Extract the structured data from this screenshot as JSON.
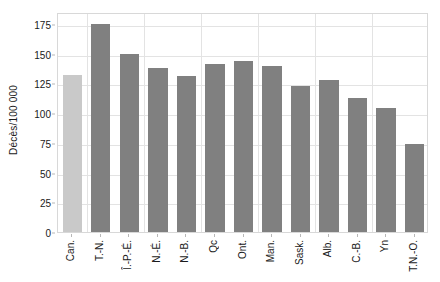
{
  "chart_data": {
    "type": "bar",
    "title": "",
    "xlabel": "",
    "ylabel": "Décès/100 000",
    "ylim": [
      0,
      185
    ],
    "yticks": [
      0,
      25,
      50,
      75,
      100,
      125,
      150,
      175
    ],
    "ytick_labels": [
      "0",
      "25",
      "50",
      "75",
      "100",
      "125",
      "150",
      "175"
    ],
    "grid": true,
    "legend": "none",
    "categories": [
      "Can.",
      "T.-N.",
      "Î.-P.-É.",
      "N.-É.",
      "N.-B.",
      "Qc",
      "Ont.",
      "Man.",
      "Sask.",
      "Alb.",
      "C.-B.",
      "Yn",
      "T.N.-O."
    ],
    "values": [
      132,
      175,
      150,
      138,
      131,
      141,
      144,
      140,
      123,
      128,
      113,
      104,
      74
    ],
    "bar_colors": [
      "#c9c9c9",
      "#808080",
      "#808080",
      "#808080",
      "#808080",
      "#808080",
      "#808080",
      "#808080",
      "#808080",
      "#808080",
      "#808080",
      "#808080",
      "#808080"
    ]
  },
  "colors": {
    "highlight_bar": "#c9c9c9",
    "default_bar": "#808080",
    "gridline": "#e3e3e3",
    "axis_frame": "#d8d8d8",
    "text": "#1a1a1a",
    "background": "#ffffff"
  }
}
